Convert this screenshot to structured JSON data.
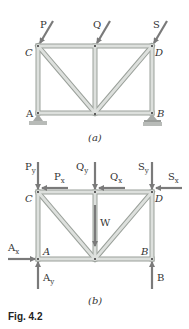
{
  "figure": {
    "caption": "Fig. 4.2",
    "colors": {
      "member_fill": "#d9dcd9",
      "member_edge": "#9aa09a",
      "force_arrow": "#7a7a7a",
      "support": "#a7aaa7",
      "text": "#333333"
    }
  },
  "part_a": {
    "label": "(a)",
    "nodes": {
      "C": "C",
      "D": "D",
      "A": "A",
      "B": "B"
    },
    "forces": {
      "P": "P",
      "Q": "Q",
      "S": "S"
    },
    "supports": [
      "pin at A",
      "roller at B"
    ]
  },
  "part_b": {
    "label": "(b)",
    "nodes": {
      "C": "C",
      "D": "D",
      "A": "A",
      "B": "B"
    },
    "forces": {
      "Py": "P",
      "Py_sub": "y",
      "Px": "P",
      "Px_sub": "x",
      "Qy": "Q",
      "Qy_sub": "y",
      "Qx": "Q",
      "Qx_sub": "x",
      "Sy": "S",
      "Sy_sub": "y",
      "Sx": "S",
      "Sx_sub": "x",
      "W": "W",
      "Ax": "A",
      "Ax_sub": "x",
      "Ay": "A",
      "Ay_sub": "y",
      "B": "B"
    }
  }
}
